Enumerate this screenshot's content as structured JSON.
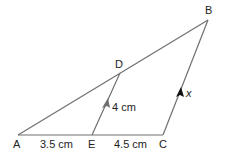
{
  "diagram": {
    "type": "geometry-triangle",
    "colors": {
      "line": "#707070",
      "arrow": "#707070",
      "arrow_cb": "#111111",
      "text": "#222222"
    },
    "points": {
      "A": {
        "label": "A",
        "x": 18,
        "y": 135
      },
      "B": {
        "label": "B",
        "x": 208,
        "y": 20
      },
      "C": {
        "label": "C",
        "x": 163,
        "y": 135
      },
      "D": {
        "label": "D",
        "x": 120,
        "y": 73
      },
      "E": {
        "label": "E",
        "x": 92,
        "y": 135
      }
    },
    "segments": [
      {
        "from": "A",
        "to": "C",
        "name": "base-ac"
      },
      {
        "from": "A",
        "to": "B",
        "name": "side-ab"
      },
      {
        "from": "C",
        "to": "B",
        "name": "side-cb"
      },
      {
        "from": "E",
        "to": "D",
        "name": "segment-ed"
      }
    ],
    "measurements": {
      "ae": "3.5 cm",
      "ec": "4.5 cm",
      "ed": "4 cm",
      "cb": "x"
    },
    "parallel_marks": [
      "ED",
      "CB"
    ]
  }
}
